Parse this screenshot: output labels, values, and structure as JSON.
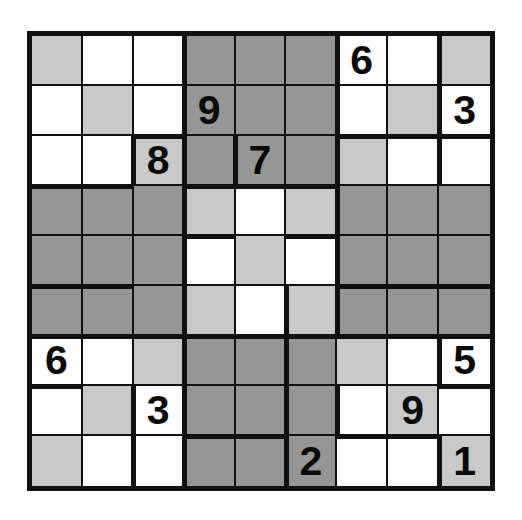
{
  "puzzle": {
    "name": "jigsaw-sudoku-grid",
    "size": 9,
    "colors": {
      "white": "#ffffff",
      "light_gray": "#c9c9c9",
      "dark_gray": "#969696",
      "line": "#111111",
      "digit": "#0a0a0a",
      "background": "#ffffff"
    },
    "givens": [
      {
        "row": 1,
        "col": 7,
        "value": "6"
      },
      {
        "row": 2,
        "col": 4,
        "value": "9"
      },
      {
        "row": 2,
        "col": 9,
        "value": "3"
      },
      {
        "row": 3,
        "col": 3,
        "value": "8"
      },
      {
        "row": 3,
        "col": 5,
        "value": "7"
      },
      {
        "row": 7,
        "col": 1,
        "value": "6"
      },
      {
        "row": 7,
        "col": 9,
        "value": "5"
      },
      {
        "row": 8,
        "col": 3,
        "value": "3"
      },
      {
        "row": 8,
        "col": 8,
        "value": "9"
      },
      {
        "row": 9,
        "col": 6,
        "value": "2"
      },
      {
        "row": 9,
        "col": 9,
        "value": "1"
      }
    ],
    "cells": [
      [
        {
          "shade": "light",
          "value": ""
        },
        {
          "shade": "white",
          "value": ""
        },
        {
          "shade": "white",
          "value": ""
        },
        {
          "shade": "dark",
          "value": ""
        },
        {
          "shade": "dark",
          "value": ""
        },
        {
          "shade": "dark",
          "value": ""
        },
        {
          "shade": "white",
          "value": "6"
        },
        {
          "shade": "white",
          "value": ""
        },
        {
          "shade": "light",
          "value": ""
        }
      ],
      [
        {
          "shade": "white",
          "value": ""
        },
        {
          "shade": "light",
          "value": ""
        },
        {
          "shade": "white",
          "value": ""
        },
        {
          "shade": "dark",
          "value": "9"
        },
        {
          "shade": "dark",
          "value": ""
        },
        {
          "shade": "dark",
          "value": ""
        },
        {
          "shade": "white",
          "value": ""
        },
        {
          "shade": "light",
          "value": ""
        },
        {
          "shade": "white",
          "value": "3"
        }
      ],
      [
        {
          "shade": "white",
          "value": ""
        },
        {
          "shade": "white",
          "value": ""
        },
        {
          "shade": "light",
          "value": "8"
        },
        {
          "shade": "dark",
          "value": ""
        },
        {
          "shade": "dark",
          "value": "7"
        },
        {
          "shade": "dark",
          "value": ""
        },
        {
          "shade": "light",
          "value": ""
        },
        {
          "shade": "white",
          "value": ""
        },
        {
          "shade": "white",
          "value": ""
        }
      ],
      [
        {
          "shade": "dark",
          "value": ""
        },
        {
          "shade": "dark",
          "value": ""
        },
        {
          "shade": "dark",
          "value": ""
        },
        {
          "shade": "light",
          "value": ""
        },
        {
          "shade": "white",
          "value": ""
        },
        {
          "shade": "light",
          "value": ""
        },
        {
          "shade": "dark",
          "value": ""
        },
        {
          "shade": "dark",
          "value": ""
        },
        {
          "shade": "dark",
          "value": ""
        }
      ],
      [
        {
          "shade": "dark",
          "value": ""
        },
        {
          "shade": "dark",
          "value": ""
        },
        {
          "shade": "dark",
          "value": ""
        },
        {
          "shade": "white",
          "value": ""
        },
        {
          "shade": "light",
          "value": ""
        },
        {
          "shade": "white",
          "value": ""
        },
        {
          "shade": "dark",
          "value": ""
        },
        {
          "shade": "dark",
          "value": ""
        },
        {
          "shade": "dark",
          "value": ""
        }
      ],
      [
        {
          "shade": "dark",
          "value": ""
        },
        {
          "shade": "dark",
          "value": ""
        },
        {
          "shade": "dark",
          "value": ""
        },
        {
          "shade": "light",
          "value": ""
        },
        {
          "shade": "white",
          "value": ""
        },
        {
          "shade": "light",
          "value": ""
        },
        {
          "shade": "dark",
          "value": ""
        },
        {
          "shade": "dark",
          "value": ""
        },
        {
          "shade": "dark",
          "value": ""
        }
      ],
      [
        {
          "shade": "white",
          "value": "6"
        },
        {
          "shade": "white",
          "value": ""
        },
        {
          "shade": "light",
          "value": ""
        },
        {
          "shade": "dark",
          "value": ""
        },
        {
          "shade": "dark",
          "value": ""
        },
        {
          "shade": "dark",
          "value": ""
        },
        {
          "shade": "light",
          "value": ""
        },
        {
          "shade": "white",
          "value": ""
        },
        {
          "shade": "white",
          "value": "5"
        }
      ],
      [
        {
          "shade": "white",
          "value": ""
        },
        {
          "shade": "light",
          "value": ""
        },
        {
          "shade": "white",
          "value": "3"
        },
        {
          "shade": "dark",
          "value": ""
        },
        {
          "shade": "dark",
          "value": ""
        },
        {
          "shade": "dark",
          "value": ""
        },
        {
          "shade": "white",
          "value": ""
        },
        {
          "shade": "light",
          "value": "9"
        },
        {
          "shade": "white",
          "value": ""
        }
      ],
      [
        {
          "shade": "light",
          "value": ""
        },
        {
          "shade": "white",
          "value": ""
        },
        {
          "shade": "white",
          "value": ""
        },
        {
          "shade": "dark",
          "value": ""
        },
        {
          "shade": "dark",
          "value": ""
        },
        {
          "shade": "dark",
          "value": "2"
        },
        {
          "shade": "white",
          "value": ""
        },
        {
          "shade": "white",
          "value": ""
        },
        {
          "shade": "light",
          "value": "1"
        }
      ]
    ],
    "region_edges": {
      "horizontal": [
        [
          3,
          0
        ],
        [
          3,
          1
        ],
        [
          2,
          2
        ],
        [
          3,
          3
        ],
        [
          3,
          4
        ],
        [
          3,
          5
        ],
        [
          2,
          6
        ],
        [
          2,
          7
        ],
        [
          2,
          8
        ],
        [
          4,
          3
        ],
        [
          4,
          5
        ],
        [
          5,
          6
        ],
        [
          5,
          7
        ],
        [
          5,
          8
        ],
        [
          5,
          0
        ],
        [
          5,
          1
        ],
        [
          6,
          0
        ],
        [
          6,
          1
        ],
        [
          6,
          2
        ],
        [
          6,
          3
        ],
        [
          6,
          4
        ],
        [
          6,
          5
        ],
        [
          6,
          6
        ],
        [
          6,
          7
        ],
        [
          6,
          8
        ],
        [
          7,
          0
        ],
        [
          7,
          8
        ],
        [
          8,
          3
        ],
        [
          8,
          4
        ],
        [
          8,
          6
        ],
        [
          8,
          7
        ]
      ],
      "vertical": [
        [
          0,
          3
        ],
        [
          1,
          3
        ],
        [
          2,
          3
        ],
        [
          0,
          6
        ],
        [
          1,
          6
        ],
        [
          2,
          4
        ],
        [
          2,
          6
        ],
        [
          2,
          8
        ],
        [
          3,
          3
        ],
        [
          3,
          6
        ],
        [
          4,
          3
        ],
        [
          4,
          6
        ],
        [
          5,
          3
        ],
        [
          5,
          5
        ],
        [
          5,
          6
        ],
        [
          6,
          3
        ],
        [
          6,
          5
        ],
        [
          6,
          8
        ],
        [
          7,
          3
        ],
        [
          7,
          5
        ],
        [
          7,
          6
        ],
        [
          8,
          3
        ],
        [
          8,
          5
        ],
        [
          8,
          8
        ],
        [
          0,
          8
        ],
        [
          1,
          8
        ],
        [
          2,
          2
        ],
        [
          7,
          2
        ],
        [
          8,
          2
        ]
      ]
    }
  }
}
